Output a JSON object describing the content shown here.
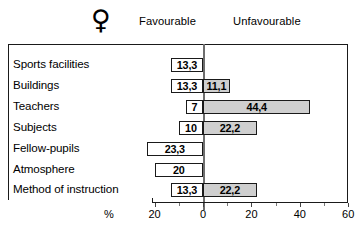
{
  "header": {
    "gender_symbol": "♀",
    "gender_symbol_name": "female-venus-symbol",
    "favourable_label": "Favourable",
    "unfavourable_label": "Unfavourable"
  },
  "axis": {
    "unit_label": "%",
    "ticks": [
      {
        "label": "20",
        "value": -20
      },
      {
        "label": "0",
        "value": 0
      },
      {
        "label": "20",
        "value": 20
      },
      {
        "label": "40",
        "value": 40
      },
      {
        "label": "60",
        "value": 60
      }
    ]
  },
  "colors": {
    "favourable_fill": "#ffffff",
    "unfavourable_fill": "#cfcfcf",
    "outline": "#1a1a1a",
    "zero_line": "#6e6e6e",
    "background": "#ffffff"
  },
  "chart_data": {
    "type": "bar",
    "orientation": "horizontal",
    "layout": "diverging",
    "title": "",
    "subtitle": "",
    "xlabel": "%",
    "ylabel": "",
    "xlim": [
      -20,
      60
    ],
    "grid": false,
    "legend_position": "top",
    "zero_at": 0,
    "categories": [
      "Sports facilities",
      "Buildings",
      "Teachers",
      "Subjects",
      "Fellow-pupils",
      "Atmosphere",
      "Method of instruction"
    ],
    "series": [
      {
        "name": "Favourable",
        "direction": "left",
        "values": [
          13.3,
          13.3,
          7,
          10,
          23.3,
          20,
          13.3
        ],
        "labels": [
          "13,3",
          "13,3",
          "7",
          "10",
          "23,3",
          "20",
          "13,3"
        ]
      },
      {
        "name": "Unfavourable",
        "direction": "right",
        "values": [
          0,
          11.1,
          44.4,
          22.2,
          0,
          0,
          22.2
        ],
        "labels": [
          "",
          "11,1",
          "44,4",
          "22,2",
          "",
          "",
          "22,2"
        ]
      }
    ]
  }
}
